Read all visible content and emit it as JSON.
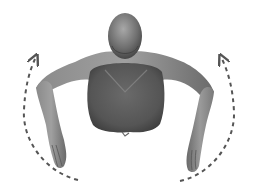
{
  "figure": {
    "alt": "Figure bent forward with arms hanging, dashed arrows indicating circular arm motion",
    "motion": "arm-circles",
    "arrows": [
      {
        "side": "left",
        "direction": "up-counterclockwise",
        "style": "dashed"
      },
      {
        "side": "right",
        "direction": "up-clockwise",
        "style": "dashed"
      }
    ],
    "colors": {
      "background": "#ffffff",
      "skin_light": "#9a9a9a",
      "skin_mid": "#777777",
      "skin_dark": "#4a4a4a",
      "arrow": "#555555"
    }
  }
}
